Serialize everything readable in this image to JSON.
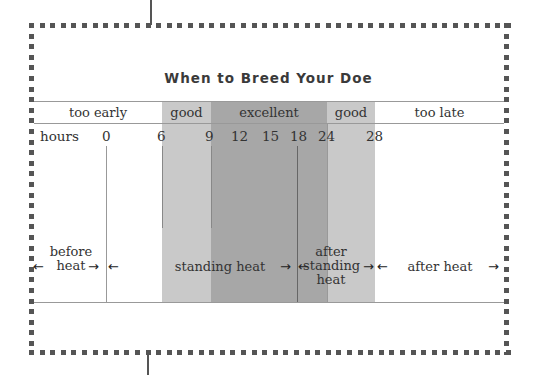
{
  "title": "When to Breed Your Doe",
  "zones": [
    {
      "label": "too early",
      "shade": "none"
    },
    {
      "label": "good",
      "shade": "light"
    },
    {
      "label": "excellent",
      "shade": "dark"
    },
    {
      "label": "good",
      "shade": "light"
    },
    {
      "label": "too late",
      "shade": "none"
    }
  ],
  "axis": {
    "label": "hours",
    "ticks": [
      "0",
      "6",
      "9",
      "12",
      "15",
      "18",
      "24",
      "28"
    ]
  },
  "phases": [
    {
      "line1": "before",
      "line2": "heat"
    },
    {
      "label": "standing heat"
    },
    {
      "line1": "after",
      "line2": "standing",
      "line3": "heat"
    },
    {
      "label": "after heat"
    }
  ],
  "arrows": {
    "left": "←",
    "right": "→"
  },
  "colors": {
    "light_band": "#c9c9c9",
    "dark_band": "#a7a7a7",
    "border_dots": "#555555"
  }
}
